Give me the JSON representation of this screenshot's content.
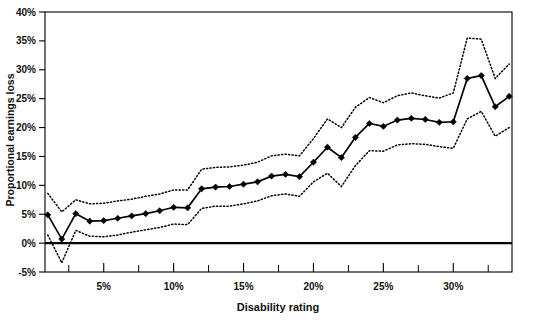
{
  "chart_data": {
    "type": "line",
    "title": "",
    "xlabel": "Disability rating",
    "ylabel": "Proportional earnings loss",
    "xlim": [
      0.8,
      34.2
    ],
    "ylim": [
      -5,
      40
    ],
    "grid": false,
    "legend": null,
    "y_tick_labels": [
      "40%",
      "35%",
      "30%",
      "25%",
      "20%",
      "15%",
      "10%",
      "5%",
      "0%",
      "-5%"
    ],
    "y_tick_values": [
      40,
      35,
      30,
      25,
      20,
      15,
      10,
      5,
      0,
      -5
    ],
    "x_tick_labels": [
      "5%",
      "10%",
      "15%",
      "20%",
      "25%",
      "30%"
    ],
    "x_tick_values": [
      5,
      10,
      15,
      20,
      25,
      30
    ],
    "x_minor_tick_values": [
      2.5,
      7.5,
      12.5,
      17.5,
      22.5,
      27.5,
      32.5
    ],
    "x": [
      1,
      2,
      3,
      4,
      5,
      6,
      7,
      8,
      9,
      10,
      11,
      12,
      13,
      14,
      15,
      16,
      17,
      18,
      19,
      20,
      21,
      22,
      23,
      24,
      25,
      26,
      27,
      28,
      29,
      30,
      31,
      32,
      33,
      34
    ],
    "series": [
      {
        "name": "Estimate",
        "style": "solid-with-diamond-markers",
        "values": [
          4.9,
          0.7,
          5.1,
          3.8,
          3.9,
          4.3,
          4.7,
          5.1,
          5.6,
          6.2,
          6.1,
          9.4,
          9.7,
          9.8,
          10.2,
          10.6,
          11.6,
          11.9,
          11.5,
          14.0,
          16.6,
          14.8,
          18.3,
          20.7,
          20.2,
          21.3,
          21.6,
          21.4,
          20.9,
          21.0,
          28.5,
          29.0,
          23.6,
          25.4
        ]
      },
      {
        "name": "Upper 95% confidence bound",
        "style": "dotted",
        "values": [
          8.6,
          5.4,
          7.5,
          6.8,
          6.9,
          7.3,
          7.6,
          8.1,
          8.5,
          9.2,
          9.2,
          12.8,
          13.1,
          13.2,
          13.5,
          14.0,
          15.1,
          15.4,
          15.1,
          18.1,
          21.5,
          20.0,
          23.5,
          25.2,
          24.3,
          25.5,
          26.0,
          25.5,
          25.1,
          26.0,
          35.5,
          35.3,
          28.5,
          31.0
        ]
      },
      {
        "name": "Lower 95% confidence bound",
        "style": "dotted",
        "values": [
          1.4,
          -3.4,
          2.2,
          1.2,
          1.1,
          1.4,
          1.9,
          2.3,
          2.7,
          3.3,
          3.2,
          6.0,
          6.4,
          6.4,
          6.8,
          7.3,
          8.2,
          8.5,
          8.1,
          10.6,
          12.1,
          9.8,
          13.4,
          16.0,
          15.9,
          17.0,
          17.2,
          17.1,
          16.7,
          16.4,
          21.5,
          22.8,
          18.5,
          20.0
        ]
      }
    ]
  },
  "colors": {
    "ink": "#000000",
    "background": "#ffffff"
  }
}
